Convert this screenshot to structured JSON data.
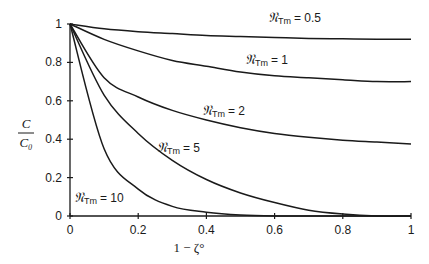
{
  "chart_data": {
    "type": "line",
    "title": "",
    "xlabel": "1 − ζ°",
    "ylabel": "C / C₀",
    "xlim": [
      0,
      1
    ],
    "ylim": [
      0,
      1
    ],
    "grid": false,
    "legend": "inline labels",
    "x": [
      0,
      0.1,
      0.2,
      0.3,
      0.4,
      0.5,
      0.6,
      0.7,
      0.8,
      0.9,
      1.0
    ],
    "x_ticks": [
      "0",
      "0.2",
      "0.4",
      "0.6",
      "0.8",
      "1"
    ],
    "y_ticks": [
      "0",
      "0.2",
      "0.4",
      "0.6",
      "0.8",
      "1"
    ],
    "series": [
      {
        "name": "𝔑Tm = 0.5",
        "values": [
          1,
          0.975,
          0.96,
          0.95,
          0.94,
          0.935,
          0.93,
          0.925,
          0.923,
          0.921,
          0.92
        ]
      },
      {
        "name": "𝔑Tm = 1",
        "values": [
          1,
          0.92,
          0.86,
          0.81,
          0.78,
          0.75,
          0.73,
          0.72,
          0.71,
          0.7,
          0.7
        ]
      },
      {
        "name": "𝔑Tm = 2",
        "values": [
          1,
          0.72,
          0.62,
          0.55,
          0.5,
          0.46,
          0.43,
          0.41,
          0.395,
          0.385,
          0.375
        ]
      },
      {
        "name": "𝔑Tm = 5",
        "values": [
          1,
          0.63,
          0.43,
          0.29,
          0.19,
          0.12,
          0.07,
          0.03,
          0.01,
          0,
          0
        ]
      },
      {
        "name": "𝔑Tm = 10",
        "values": [
          1,
          0.35,
          0.14,
          0.05,
          0.02,
          0.005,
          0,
          0,
          0,
          0,
          0
        ]
      }
    ]
  },
  "labels": {
    "series_prefix": "𝔑",
    "series_sub": "Tm",
    "s05": "= 0.5",
    "s1": "= 1",
    "s2": "= 2",
    "s5": "= 5",
    "s10": "= 10",
    "ylabel_num": "C",
    "ylabel_den": "C₀",
    "xlabel": "1 − ζ°"
  }
}
